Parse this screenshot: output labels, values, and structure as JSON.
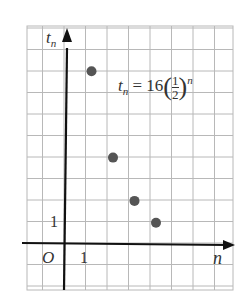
{
  "chart_data": {
    "type": "scatter",
    "title": "",
    "xlabel": "n",
    "ylabel": "t_n",
    "annotation": "t_n = 16(1/2)^n",
    "formula": {
      "lhs": "t",
      "lhs_sub": "n",
      "eq": "= 16",
      "num": "1",
      "den": "2",
      "exp": "n"
    },
    "origin_label": "O",
    "x_tick_label": "1",
    "y_tick_label": "1",
    "x": [
      1,
      2,
      3,
      4
    ],
    "y": [
      8,
      4,
      2,
      1
    ],
    "xlim": [
      -1,
      9
    ],
    "ylim": [
      -2,
      10
    ],
    "grid": true,
    "legend": "none",
    "point_color": "#555555",
    "axis_color": "#111111",
    "grid_color": "#b8b8b8"
  }
}
